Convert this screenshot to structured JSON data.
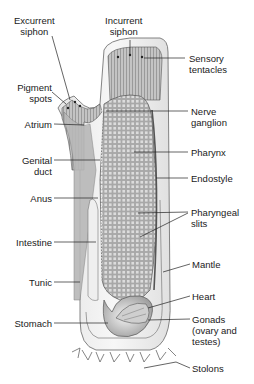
{
  "diagram": {
    "labels": {
      "excurrent_siphon": [
        "Excurrent",
        "siphon"
      ],
      "incurrent_siphon": [
        "Incurrent",
        "siphon"
      ],
      "sensory_tentacles": [
        "Sensory",
        "tentacles"
      ],
      "pigment_spots": [
        "Pigment",
        "spots"
      ],
      "atrium": [
        "Atrium"
      ],
      "nerve_ganglion": [
        "Nerve",
        "ganglion"
      ],
      "pharynx": [
        "Pharynx"
      ],
      "genital_duct": [
        "Genital",
        "duct"
      ],
      "endostyle": [
        "Endostyle"
      ],
      "anus": [
        "Anus"
      ],
      "pharyngeal_slits": [
        "Pharyngeal",
        "slits"
      ],
      "intestine": [
        "Intestine"
      ],
      "mantle": [
        "Mantle"
      ],
      "tunic": [
        "Tunic"
      ],
      "heart": [
        "Heart"
      ],
      "stomach": [
        "Stomach"
      ],
      "gonads": [
        "Gonads",
        "(ovary and",
        "testes)"
      ],
      "stolons": [
        "Stolons"
      ]
    },
    "colors": {
      "ink": "#1a1a1a",
      "body_fill": "#d9d9d9",
      "pharynx_fill": "#bdbdbd",
      "tunic_fill": "#f2f2f2"
    }
  }
}
